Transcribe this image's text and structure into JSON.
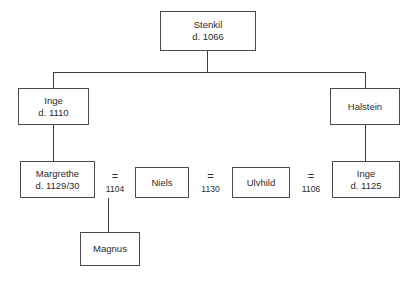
{
  "diagram": {
    "type": "family-tree",
    "title": "",
    "background_color": "#ffffff",
    "box_border_color": "#4a4a4a",
    "line_color": "#3b3b3b",
    "text_color": "#2b2b2b"
  },
  "nodes": {
    "stenkil": {
      "name": "Stenkil",
      "death": "d. 1066"
    },
    "inge_elder": {
      "name": "Inge",
      "death": "d. 1110"
    },
    "halstein": {
      "name": "Halstein",
      "death": ""
    },
    "margrethe": {
      "name": "Margrethe",
      "death": "d. 1129/30"
    },
    "niels": {
      "name": "Niels",
      "death": ""
    },
    "ulvhild": {
      "name": "Ulvhild",
      "death": ""
    },
    "inge_younger": {
      "name": "Inge",
      "death": "d. 1125"
    },
    "magnus": {
      "name": "Magnus",
      "death": ""
    }
  },
  "marriages": [
    {
      "id": "margrethe-niels",
      "symbol": "=",
      "year": "1104"
    },
    {
      "id": "niels-ulvhild",
      "symbol": "=",
      "year": "1130"
    },
    {
      "id": "ulvhild-inge",
      "symbol": "=",
      "year": "1106"
    }
  ]
}
